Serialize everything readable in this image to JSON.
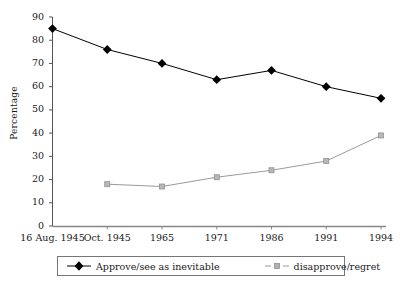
{
  "chart_data": {
    "type": "line",
    "title": "",
    "xlabel": "",
    "ylabel": "Percentage",
    "ylim": [
      0,
      90
    ],
    "ytick_step": 10,
    "grid": false,
    "legend_position": "bottom",
    "categories": [
      "16 Aug. 1945",
      "Oct. 1945",
      "1965",
      "1971",
      "1986",
      "1991",
      "1994"
    ],
    "yticks": [
      "0",
      "10",
      "20",
      "30",
      "40",
      "50",
      "60",
      "70",
      "80",
      "90"
    ],
    "series": [
      {
        "name": "Approve/see as inevitable",
        "marker": "diamond",
        "color": "#000000",
        "values": [
          85,
          76,
          70,
          63,
          67,
          60,
          55
        ]
      },
      {
        "name": "disapprove/regret",
        "marker": "square",
        "color": "#9a9a9a",
        "values": [
          null,
          18,
          17,
          21,
          24,
          28,
          39
        ]
      }
    ]
  },
  "legend": {
    "entries": [
      {
        "label": "Approve/see as inevitable"
      },
      {
        "label": "disapprove/regret"
      }
    ]
  },
  "colors": {
    "approve": "#000000",
    "disapprove": "#9a9a9a",
    "axis": "#555555",
    "legend_border": "#767676"
  }
}
